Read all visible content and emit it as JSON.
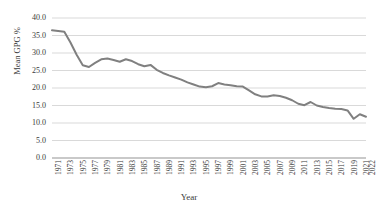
{
  "chart_data": {
    "type": "line",
    "title": "",
    "xlabel": "Year",
    "ylabel": "Mean GPG %",
    "ylim": [
      0,
      40
    ],
    "ytick_step": 5,
    "ytick_labels": [
      "40.0",
      "35.0",
      "30.0",
      "25.0",
      "20.0",
      "15.0",
      "10.0",
      "5.0",
      "0.0"
    ],
    "grid": "horizontal",
    "legend": "none",
    "line_color": "#808080",
    "grid_color": "#d9d9d9",
    "x": [
      1971,
      1972,
      1973,
      1974,
      1975,
      1976,
      1977,
      1978,
      1979,
      1980,
      1981,
      1982,
      1983,
      1984,
      1985,
      1986,
      1987,
      1988,
      1989,
      1990,
      1991,
      1992,
      1993,
      1994,
      1995,
      1996,
      1997,
      1998,
      1999,
      2000,
      2001,
      2002,
      2003,
      2004,
      2005,
      2006,
      2007,
      2008,
      2009,
      2010,
      2011,
      2012,
      2013,
      2014,
      2015,
      2016,
      2017,
      2018,
      2019,
      2020,
      2021,
      2022
    ],
    "xtick_labels": [
      "1971",
      "1973",
      "1975",
      "1977",
      "1979",
      "1981",
      "1983",
      "1985",
      "1987",
      "1989",
      "1991",
      "1993",
      "1995",
      "1997",
      "1999",
      "2001",
      "2003",
      "2005",
      "2007",
      "2009",
      "2011",
      "2013",
      "2015",
      "2017",
      "2019",
      "2021",
      "2022"
    ],
    "values": [
      36.5,
      36.3,
      36.1,
      33.0,
      29.5,
      26.5,
      26.0,
      27.2,
      28.2,
      28.4,
      28.0,
      27.5,
      28.2,
      27.7,
      26.8,
      26.2,
      26.6,
      25.2,
      24.3,
      23.6,
      23.0,
      22.4,
      21.6,
      21.0,
      20.4,
      20.2,
      20.5,
      21.4,
      21.0,
      20.8,
      20.5,
      20.4,
      19.3,
      18.2,
      17.6,
      17.6,
      17.9,
      17.7,
      17.2,
      16.5,
      15.5,
      15.1,
      16.0,
      15.0,
      14.6,
      14.3,
      14.1,
      14.0,
      13.6,
      11.2,
      12.5,
      11.8
    ]
  }
}
